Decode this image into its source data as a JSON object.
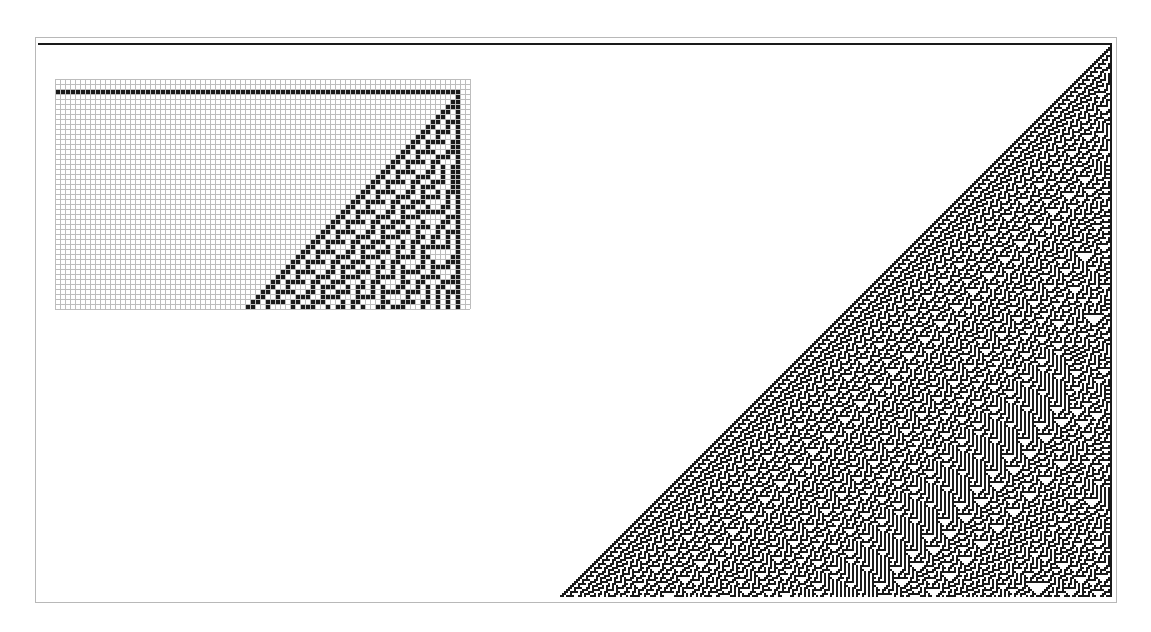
{
  "figure": {
    "rule": 30,
    "colors": {
      "cell_on": "#1a1a1a",
      "cell_off": "#ffffff",
      "frame": "#b8b8b8",
      "grid": "#bdbdbd"
    }
  },
  "main": {
    "cell_px": 2,
    "cols": 537,
    "rows": 277
  },
  "inset": {
    "cell_px": 5,
    "cols": 83,
    "rows": 46,
    "gridlines": true
  }
}
